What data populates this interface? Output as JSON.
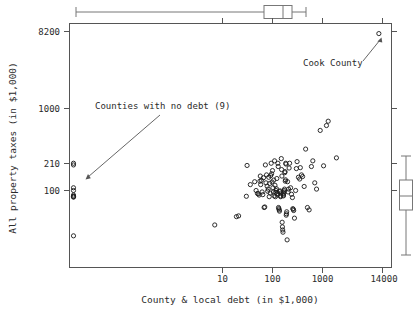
{
  "chart_data": {
    "type": "scatter",
    "title": "",
    "xlabel": "County & local debt (in $1,000)",
    "ylabel": "All property taxes (in $1,000)",
    "xscale": "log",
    "yscale": "log",
    "grid": false,
    "legend": "none",
    "x_ticks": [
      {
        "label": "10",
        "value": 10
      },
      {
        "label": "100",
        "value": 100
      },
      {
        "label": "1000",
        "value": 1000
      },
      {
        "label": "14000",
        "value": 14000
      }
    ],
    "y_ticks": [
      {
        "label": "8200",
        "value": 8200
      },
      {
        "label": "1000",
        "value": 1000
      },
      {
        "label": "210",
        "value": 210
      },
      {
        "label": "100",
        "value": 100
      }
    ],
    "annotations": [
      {
        "text": "Cook County",
        "points_to": "top-right-outlier"
      },
      {
        "text": "Counties with no debt (9)",
        "points_to": "zero-debt-column"
      }
    ],
    "zero_debt_count": 9,
    "zero_debt_points": [
      [
        0,
        215
      ],
      [
        0,
        205
      ],
      [
        0,
        108
      ],
      [
        0,
        100
      ],
      [
        0,
        88
      ],
      [
        0,
        85
      ],
      [
        0,
        84
      ],
      [
        0,
        83
      ],
      [
        0,
        28
      ]
    ],
    "points": [
      [
        13400,
        8200
      ],
      [
        7.0,
        38
      ],
      [
        19,
        48
      ],
      [
        21,
        49
      ],
      [
        30,
        85
      ],
      [
        31,
        202
      ],
      [
        36,
        118
      ],
      [
        44,
        128
      ],
      [
        47,
        100
      ],
      [
        50,
        92
      ],
      [
        52,
        91
      ],
      [
        54,
        88
      ],
      [
        56,
        130
      ],
      [
        57,
        150
      ],
      [
        58,
        118
      ],
      [
        60,
        133
      ],
      [
        62,
        96
      ],
      [
        64,
        89
      ],
      [
        66,
        143
      ],
      [
        68,
        62
      ],
      [
        70,
        63
      ],
      [
        72,
        205
      ],
      [
        74,
        124
      ],
      [
        76,
        155
      ],
      [
        78,
        113
      ],
      [
        80,
        98
      ],
      [
        82,
        104
      ],
      [
        84,
        145
      ],
      [
        86,
        84
      ],
      [
        88,
        122
      ],
      [
        90,
        93
      ],
      [
        92,
        152
      ],
      [
        94,
        215
      ],
      [
        96,
        160
      ],
      [
        98,
        127
      ],
      [
        100,
        175
      ],
      [
        102,
        108
      ],
      [
        104,
        96
      ],
      [
        106,
        134
      ],
      [
        108,
        86
      ],
      [
        110,
        230
      ],
      [
        112,
        116
      ],
      [
        114,
        84
      ],
      [
        116,
        95
      ],
      [
        118,
        100
      ],
      [
        120,
        105
      ],
      [
        122,
        140
      ],
      [
        124,
        92
      ],
      [
        126,
        88
      ],
      [
        128,
        215
      ],
      [
        130,
        196
      ],
      [
        132,
        62
      ],
      [
        134,
        60
      ],
      [
        136,
        58
      ],
      [
        138,
        56
      ],
      [
        140,
        97
      ],
      [
        142,
        99
      ],
      [
        144,
        86
      ],
      [
        146,
        84
      ],
      [
        148,
        93
      ],
      [
        150,
        245
      ],
      [
        152,
        180
      ],
      [
        154,
        150
      ],
      [
        156,
        41
      ],
      [
        158,
        36
      ],
      [
        160,
        33
      ],
      [
        162,
        31
      ],
      [
        164,
        88
      ],
      [
        166,
        86
      ],
      [
        168,
        92
      ],
      [
        170,
        96
      ],
      [
        172,
        100
      ],
      [
        174,
        104
      ],
      [
        176,
        165
      ],
      [
        178,
        170
      ],
      [
        180,
        130
      ],
      [
        182,
        135
      ],
      [
        184,
        215
      ],
      [
        186,
        210
      ],
      [
        188,
        50
      ],
      [
        190,
        52
      ],
      [
        192,
        55
      ],
      [
        196,
        25
      ],
      [
        200,
        128
      ],
      [
        205,
        96
      ],
      [
        210,
        104
      ],
      [
        215,
        188
      ],
      [
        220,
        215
      ],
      [
        230,
        108
      ],
      [
        240,
        90
      ],
      [
        250,
        82
      ],
      [
        255,
        60
      ],
      [
        260,
        59
      ],
      [
        265,
        57
      ],
      [
        275,
        46
      ],
      [
        290,
        100
      ],
      [
        300,
        185
      ],
      [
        310,
        225
      ],
      [
        330,
        145
      ],
      [
        350,
        138
      ],
      [
        360,
        190
      ],
      [
        380,
        155
      ],
      [
        400,
        148
      ],
      [
        430,
        112
      ],
      [
        460,
        320
      ],
      [
        500,
        62
      ],
      [
        540,
        58
      ],
      [
        600,
        196
      ],
      [
        640,
        230
      ],
      [
        700,
        124
      ],
      [
        760,
        104
      ],
      [
        900,
        540
      ],
      [
        1050,
        200
      ],
      [
        1200,
        620
      ],
      [
        1300,
        700
      ],
      [
        1900,
        250
      ]
    ],
    "top_boxplot": {
      "axis": "x",
      "whisker_low": 2,
      "q1": 95,
      "median": 165,
      "q3": 260,
      "whisker_high": 900
    },
    "right_boxplot": {
      "axis": "y",
      "whisker_low": 30,
      "q1": 82,
      "median": 104,
      "q3": 155,
      "whisker_high": 250
    }
  }
}
